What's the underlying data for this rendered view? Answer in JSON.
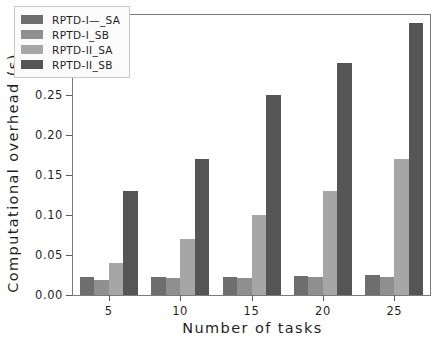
{
  "chart_data": {
    "type": "bar",
    "title": "",
    "xlabel": "Number of tasks",
    "ylabel": "Computational overhead (s)",
    "categories": [
      "5",
      "10",
      "15",
      "20",
      "25"
    ],
    "ylim": [
      0.0,
      0.35
    ],
    "yticks": [
      "0.00",
      "0.05",
      "0.10",
      "0.15",
      "0.20",
      "0.25",
      "0.30",
      "0.35"
    ],
    "ytick_values": [
      0.0,
      0.05,
      0.1,
      0.15,
      0.2,
      0.25,
      0.3,
      0.35
    ],
    "grid": false,
    "legend_position": "upper left",
    "series": [
      {
        "name": "RPTD-I—_SA",
        "color": "#6e6e6e",
        "values": [
          0.022,
          0.022,
          0.023,
          0.024,
          0.025
        ]
      },
      {
        "name": "RPTD-I_SB",
        "color": "#8f8f8f",
        "values": [
          0.019,
          0.021,
          0.021,
          0.022,
          0.023
        ]
      },
      {
        "name": "RPTD-II_SA",
        "color": "#a6a6a6",
        "values": [
          0.04,
          0.07,
          0.1,
          0.13,
          0.17
        ]
      },
      {
        "name": "RPTD-II_SB",
        "color": "#555555",
        "values": [
          0.13,
          0.17,
          0.25,
          0.29,
          0.34
        ]
      }
    ]
  }
}
